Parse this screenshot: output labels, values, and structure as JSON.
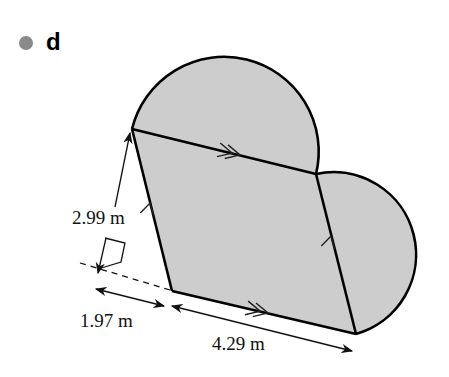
{
  "part_label": "d",
  "colors": {
    "shape_fill": "#cdcdcd",
    "outline": "#000000",
    "bullet": "#8a8a8a"
  },
  "shape": {
    "type": "parallelogram with two semicircles",
    "parallelogram_vertices": [
      [
        132,
        129
      ],
      [
        316,
        174
      ],
      [
        356,
        334
      ],
      [
        172,
        291
      ]
    ],
    "semicircles": [
      {
        "on_side": "top (A-B)",
        "diameter_between": [
          [
            132,
            129
          ],
          [
            316,
            174
          ]
        ]
      },
      {
        "on_side": "right (B-C)",
        "diameter_between": [
          [
            316,
            174
          ],
          [
            356,
            334
          ]
        ]
      }
    ],
    "parallel_markers": {
      "single_arrow_sides": [
        "left",
        "right"
      ],
      "double_arrow_sides": [
        "top",
        "bottom"
      ]
    }
  },
  "dimensions": {
    "height_label": "2.99 m",
    "offset_label": "1.97 m",
    "base_label": "4.29 m"
  }
}
